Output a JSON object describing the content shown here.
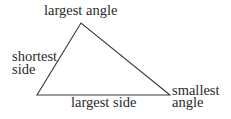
{
  "diagram": {
    "shape": "triangle",
    "vertices": {
      "top": [
        81,
        23
      ],
      "bottom_left": [
        37,
        95
      ],
      "bottom_right": [
        170,
        95
      ]
    },
    "stroke_color": "#3a3a3a",
    "labels": {
      "top_vertex": "largest angle",
      "left_side_line1": "shortest",
      "left_side_line2": "side",
      "bottom_side": "largest side",
      "right_vertex_line1": "smallest",
      "right_vertex_line2": "angle"
    }
  }
}
